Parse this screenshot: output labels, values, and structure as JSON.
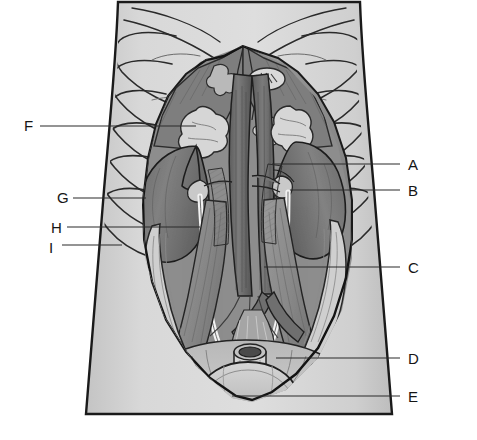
{
  "figure": {
    "type": "anatomical-illustration",
    "style": "grayscale line and tone drawing",
    "width": 477,
    "height": 440,
    "background_color": "#ffffff",
    "body_fill": "#d2d2d2",
    "outline_color": "#1a1a1a",
    "organ_fill": "#7b7b7b",
    "muscle_fill": "#8e8e8e",
    "vessel_fill": "#6e6e6e",
    "bone_fill": "#ebebeb",
    "ureter_fill": "#f4f4f4"
  },
  "labels": [
    {
      "id": "A",
      "text": "A",
      "x": 408,
      "y": 157,
      "leader_x1": 272,
      "leader_x2": 400,
      "leader_y": 164,
      "target": "renal-artery-hilum"
    },
    {
      "id": "B",
      "text": "B",
      "x": 408,
      "y": 183,
      "leader_x1": 290,
      "leader_x2": 400,
      "leader_y": 190,
      "target": "left-kidney"
    },
    {
      "id": "C",
      "text": "C",
      "x": 408,
      "y": 260,
      "leader_x1": 264,
      "leader_x2": 400,
      "leader_y": 267,
      "target": "ureter"
    },
    {
      "id": "D",
      "text": "D",
      "x": 408,
      "y": 351,
      "leader_x1": 276,
      "leader_x2": 400,
      "leader_y": 358,
      "target": "rectum-cut-end"
    },
    {
      "id": "E",
      "text": "E",
      "x": 408,
      "y": 389,
      "leader_x1": 232,
      "leader_x2": 400,
      "leader_y": 396,
      "target": "urinary-bladder"
    },
    {
      "id": "F",
      "text": "F",
      "x": 24,
      "y": 118,
      "leader_x1": 40,
      "leader_x2": 196,
      "leader_y": 126,
      "target": "right-adrenal-gland"
    },
    {
      "id": "G",
      "text": "G",
      "x": 57,
      "y": 190,
      "leader_x1": 73,
      "leader_x2": 146,
      "leader_y": 198,
      "target": "right-kidney"
    },
    {
      "id": "H",
      "text": "H",
      "x": 51,
      "y": 220,
      "leader_x1": 67,
      "leader_x2": 200,
      "leader_y": 227,
      "target": "psoas-major-muscle"
    },
    {
      "id": "I",
      "text": "I",
      "x": 49,
      "y": 240,
      "leader_x1": 62,
      "leader_x2": 122,
      "leader_y": 245,
      "target": "iliacus-muscle"
    }
  ],
  "structures": [
    "rib-cage",
    "costal-cartilage",
    "diaphragm",
    "esophageal-hiatus",
    "abdominal-aorta",
    "inferior-vena-cava",
    "right-adrenal-gland",
    "left-adrenal-gland",
    "right-kidney",
    "left-kidney",
    "renal-artery",
    "renal-vein",
    "right-ureter",
    "left-ureter",
    "common-iliac-artery",
    "common-iliac-vein",
    "psoas-major-muscle",
    "iliacus-muscle",
    "quadratus-lumborum-muscle",
    "rectum-cut-end",
    "urinary-bladder",
    "body-outline"
  ]
}
